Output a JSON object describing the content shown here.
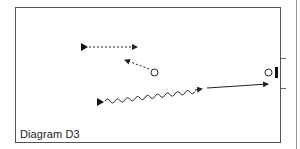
{
  "diagram": {
    "caption": "Diagram D3",
    "colors": {
      "stroke": "#222222",
      "frame": "#555555",
      "outer": "#999999",
      "background": "#ffffff"
    },
    "elements": [
      {
        "id": "player-1",
        "type": "triangle-marker",
        "x": 81,
        "y": 47
      },
      {
        "id": "pass-1",
        "type": "dotted-arrow",
        "from": [
          86,
          47
        ],
        "to": [
          137,
          47
        ]
      },
      {
        "id": "player-2",
        "type": "circle-marker",
        "x": 154,
        "y": 72
      },
      {
        "id": "pass-2",
        "type": "dotted-arrow",
        "from": [
          149,
          69
        ],
        "to": [
          125,
          60
        ]
      },
      {
        "id": "player-3",
        "type": "triangle-marker",
        "x": 98,
        "y": 102
      },
      {
        "id": "dribble-1",
        "type": "wavy-arrow",
        "from": [
          104,
          101
        ],
        "to": [
          202,
          89
        ]
      },
      {
        "id": "shot-1",
        "type": "solid-arrow",
        "from": [
          207,
          88
        ],
        "to": [
          268,
          84
        ]
      },
      {
        "id": "goalkeeper",
        "type": "circle-marker",
        "x": 268,
        "y": 73
      },
      {
        "id": "goal",
        "type": "bar",
        "x": 276,
        "y": 73
      }
    ]
  }
}
